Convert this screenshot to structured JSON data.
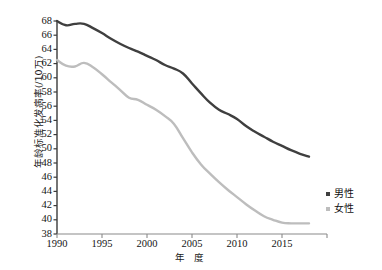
{
  "chart_data": {
    "type": "line",
    "title": "",
    "xlabel": "年 度",
    "ylabel": "年龄标准化发病率(/10万)",
    "xlim": [
      1990,
      2018
    ],
    "ylim": [
      38,
      68
    ],
    "ytick_step": 2,
    "grid": false,
    "legend_position": "right",
    "x": [
      1990,
      1991,
      1992,
      1993,
      1994,
      1995,
      1996,
      1997,
      1998,
      1999,
      2000,
      2001,
      2002,
      2003,
      2004,
      2005,
      2006,
      2007,
      2008,
      2009,
      2010,
      2011,
      2012,
      2013,
      2014,
      2015,
      2016,
      2017,
      2018
    ],
    "xticks": [
      "1990",
      "1995",
      "2000",
      "2005",
      "2010",
      "2015"
    ],
    "xtick_values": [
      1990,
      1995,
      2000,
      2005,
      2010,
      2015
    ],
    "yticks": [
      "68",
      "66",
      "64",
      "62",
      "60",
      "58",
      "56",
      "54",
      "52",
      "50",
      "48",
      "46",
      "44",
      "42",
      "40",
      "38"
    ],
    "ytick_values": [
      68,
      66,
      64,
      62,
      60,
      58,
      56,
      54,
      52,
      50,
      48,
      46,
      44,
      42,
      40,
      38
    ],
    "series": [
      {
        "name": "男性",
        "color": "#3f3f3f",
        "values": [
          68.0,
          67.4,
          67.6,
          67.6,
          67.0,
          66.3,
          65.5,
          64.8,
          64.2,
          63.7,
          63.1,
          62.5,
          61.8,
          61.3,
          60.6,
          59.2,
          57.8,
          56.5,
          55.5,
          54.9,
          54.2,
          53.2,
          52.4,
          51.7,
          51.0,
          50.4,
          49.8,
          49.3,
          48.9
        ]
      },
      {
        "name": "女性",
        "color": "#bdbdbd",
        "values": [
          62.5,
          61.7,
          61.6,
          62.1,
          61.5,
          60.5,
          59.4,
          58.3,
          57.2,
          56.9,
          56.2,
          55.5,
          54.6,
          53.5,
          51.5,
          49.5,
          47.8,
          46.5,
          45.3,
          44.2,
          43.2,
          42.2,
          41.3,
          40.5,
          40.0,
          39.6,
          39.5,
          39.5,
          39.5
        ]
      }
    ]
  },
  "legend": {
    "items": [
      {
        "label": "男性",
        "color": "#3f3f3f"
      },
      {
        "label": "女性",
        "color": "#bdbdbd"
      }
    ]
  },
  "axis": {
    "color": "#3a3a3a"
  }
}
